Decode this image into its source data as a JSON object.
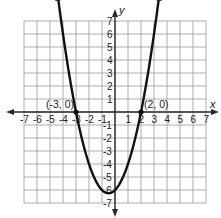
{
  "chart_data": {
    "type": "line",
    "title": "",
    "function": "y = x^2 + x - 6",
    "xlabel": "x",
    "ylabel": "y",
    "xlim": [
      -7,
      7
    ],
    "ylim": [
      -7,
      7
    ],
    "grid": true,
    "x_ticks": [
      -7,
      -6,
      -5,
      -4,
      -3,
      -2,
      -1,
      1,
      2,
      3,
      4,
      5,
      6,
      7
    ],
    "y_ticks": [
      -7,
      -6,
      -5,
      -4,
      -3,
      -2,
      -1,
      1,
      2,
      3,
      4,
      5,
      6,
      7
    ],
    "series": [
      {
        "name": "parabola",
        "x": [
          -4.5,
          -4,
          -3.5,
          -3,
          -2.5,
          -2,
          -1.5,
          -1,
          -0.5,
          0,
          0.5,
          1,
          1.5,
          2,
          2.5,
          3,
          3.5
        ],
        "y": [
          7.75,
          6,
          2.75,
          0,
          -2.25,
          -4,
          -5.25,
          -6,
          -6.25,
          -6,
          -5.25,
          -4,
          -2.25,
          0,
          2.75,
          6,
          7.75
        ]
      }
    ],
    "points": [
      {
        "x": -3,
        "y": 0,
        "label": "(-3, 0)"
      },
      {
        "x": 2,
        "y": 0,
        "label": "(2, 0)"
      }
    ],
    "annotations": [
      "(-3, 0)",
      "(2, 0)"
    ],
    "vertex": {
      "x": -0.5,
      "y": -6.25
    },
    "y_intercept": {
      "x": 0,
      "y": -6
    }
  },
  "labels": {
    "x_axis": "x",
    "y_axis": "y",
    "point_left": "(-3, 0)",
    "point_right": "(2, 0)"
  }
}
